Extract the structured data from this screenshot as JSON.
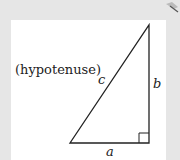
{
  "diagram": {
    "type": "right-triangle",
    "labels": {
      "hypotenuse_note": "(hypotenuse)",
      "hypotenuse": "c",
      "vertical_leg": "b",
      "horizontal_leg": "a"
    },
    "right_angle_marker": true,
    "colors": {
      "background": "#e6e6e6",
      "panel": "#ffffff",
      "stroke": "#222222"
    }
  }
}
